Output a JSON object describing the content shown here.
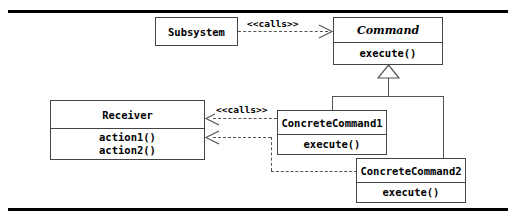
{
  "diagram": {
    "type": "uml-class-diagram",
    "background_color": "#ffffff",
    "line_color": "#555555",
    "text_color": "#000000",
    "rule_color": "#000000"
  },
  "classes": {
    "subsystem": {
      "name": "Subsystem",
      "abstract": false,
      "operations": []
    },
    "command": {
      "name": "Command",
      "abstract": true,
      "operations": [
        "execute()"
      ]
    },
    "receiver": {
      "name": "Receiver",
      "abstract": false,
      "operations": [
        "action1()",
        "action2()"
      ]
    },
    "concrete_command_1": {
      "name": "ConcreteCommand1",
      "abstract": false,
      "operations": [
        "execute()"
      ]
    },
    "concrete_command_2": {
      "name": "ConcreteCommand2",
      "abstract": false,
      "operations": [
        "execute()"
      ]
    }
  },
  "relationships": {
    "subsystem_to_command": {
      "stereotype": "<<calls>>",
      "kind": "dependency",
      "from": "Subsystem",
      "to": "Command"
    },
    "concrete_to_receiver": {
      "stereotype": "<<calls>>",
      "kind": "dependency",
      "from": "ConcreteCommand1",
      "to": "Receiver"
    },
    "concrete2_to_receiver": {
      "stereotype": "",
      "kind": "dependency",
      "from": "ConcreteCommand2",
      "to": "Receiver"
    },
    "generalization_1": {
      "kind": "generalization",
      "from": "ConcreteCommand1",
      "to": "Command"
    },
    "generalization_2": {
      "kind": "generalization",
      "from": "ConcreteCommand2",
      "to": "Command"
    }
  }
}
